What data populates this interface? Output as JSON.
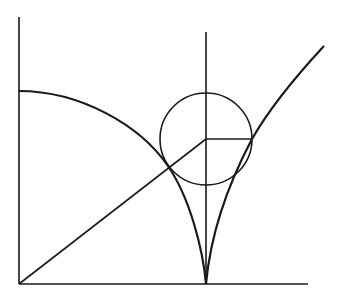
{
  "diagram": {
    "title": "",
    "stroke_color": "#1a1a1a",
    "background": "#ffffff",
    "axes": {
      "origin": [
        19,
        284
      ],
      "y_axis_top": [
        19,
        17
      ],
      "x_axis_end": [
        308,
        284
      ]
    },
    "vertical_line": {
      "x": 206,
      "y_top": 32,
      "y_bottom": 284
    },
    "circle": {
      "cx": 206,
      "cy": 139,
      "r": 46
    },
    "radius_segment": {
      "from": [
        206,
        139
      ],
      "to": [
        252,
        139
      ]
    },
    "diagonal": {
      "from": [
        19,
        284
      ],
      "to": [
        206,
        139
      ]
    },
    "left_curve": {
      "start": [
        19,
        91
      ],
      "cusp": [
        206,
        284
      ]
    },
    "right_curve": {
      "cusp": [
        206,
        284
      ],
      "through": [
        252,
        139
      ],
      "end": [
        324,
        46
      ]
    }
  }
}
